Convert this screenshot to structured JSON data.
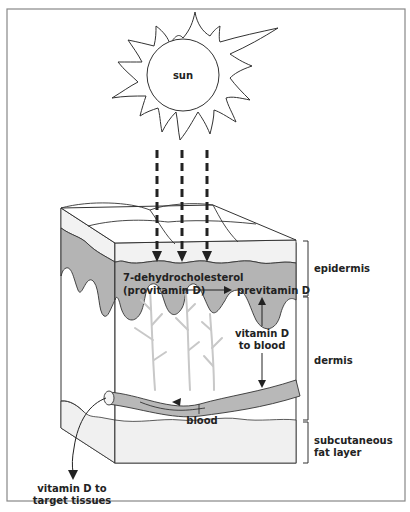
{
  "diagram": {
    "colors": {
      "frame": "#888888",
      "outline": "#333333",
      "epidermis_fill": "#b4b4b4",
      "surface_fill": "#f2f2f2",
      "fat_fill": "#f0f0f0",
      "capillary": "#c8c8c8",
      "vessel_fill": "#b8b8b8"
    },
    "labels": {
      "sun": "sun",
      "compound_line1": "7-dehydrocholesterol",
      "compound_line2": "(provitamin D)",
      "previtamin": "previtamin D",
      "to_blood_line1": "vitamin D",
      "to_blood_line2": "to blood",
      "blood": "blood",
      "target_line1": "vitamin D to",
      "target_line2": "target tissues"
    },
    "layers": [
      {
        "name": "epidermis",
        "label": "epidermis"
      },
      {
        "name": "dermis",
        "label": "dermis"
      },
      {
        "name": "subcutaneous",
        "label_line1": "subcutaneous",
        "label_line2": "fat layer"
      }
    ],
    "sun_rays": {
      "count": 3,
      "style": "dashed-arrow"
    }
  }
}
